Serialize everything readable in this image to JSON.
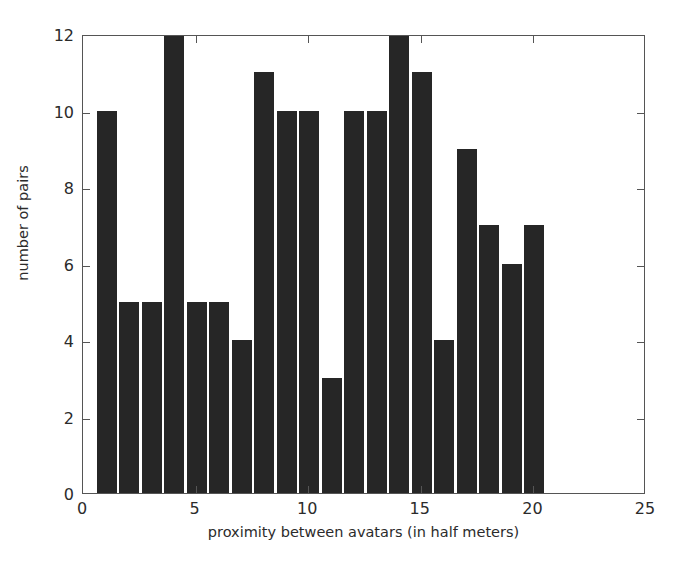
{
  "chart_data": {
    "type": "bar",
    "title": "",
    "subtitle": "",
    "xlabel": "proximity between avatars (in half meters)",
    "ylabel": "number of pairs",
    "xlim": [
      0,
      25
    ],
    "ylim": [
      0,
      12
    ],
    "xticks": [
      0,
      5,
      10,
      15,
      20,
      25
    ],
    "yticks": [
      0,
      2,
      4,
      6,
      8,
      10,
      12
    ],
    "xtick_labels": [
      "0",
      "5",
      "10",
      "15",
      "20",
      "25"
    ],
    "ytick_labels": [
      "0",
      "2",
      "4",
      "6",
      "8",
      "10",
      "12"
    ],
    "grid": false,
    "legend": null,
    "bar_color": "#262626",
    "bin_width": 1,
    "bin_left_edges": [
      0.6,
      1.6,
      2.6,
      3.6,
      4.6,
      5.6,
      6.6,
      7.6,
      8.6,
      9.6,
      10.6,
      11.6,
      12.6,
      13.6,
      14.6,
      15.6,
      16.6,
      17.6,
      18.6,
      19.6
    ],
    "categories": [
      "1",
      "2",
      "3",
      "4",
      "5",
      "6",
      "7",
      "8",
      "9",
      "10",
      "11",
      "12",
      "13",
      "14",
      "15",
      "16",
      "17",
      "18",
      "19",
      "20"
    ],
    "values": [
      10,
      5,
      5,
      12,
      5,
      5,
      4,
      11,
      10,
      10,
      3,
      10,
      10,
      12,
      11,
      4,
      9,
      7,
      6,
      7
    ],
    "annotations": []
  },
  "figure": {
    "background_color": "#ffffff",
    "axis_color": "#555555",
    "text_color": "#2b2b2b"
  }
}
